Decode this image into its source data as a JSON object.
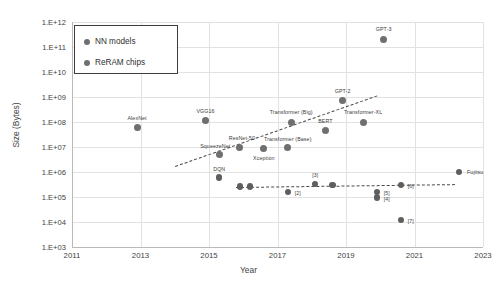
{
  "chart_data": {
    "type": "scatter",
    "title": "",
    "xlabel": "Year",
    "ylabel": "Size (Bytes)",
    "xlim": [
      2011,
      2023
    ],
    "ylim": [
      1000,
      1000000000000
    ],
    "yscale": "log",
    "grid": true,
    "legend_position": "top-left",
    "xticks": [
      "2011",
      "2013",
      "2015",
      "2017",
      "2019",
      "2021",
      "2023"
    ],
    "yticks": [
      "1.E+12",
      "1.E+11",
      "1.E+10",
      "1.E+09",
      "1.E+08",
      "1.E+07",
      "1.E+06",
      "1.E+05",
      "1.E+04",
      "1.E+03"
    ],
    "legend": [
      {
        "name": "NN models",
        "color": "#6f6f6f"
      },
      {
        "name": "ReRAM chips",
        "color": "#5e5e5e"
      }
    ],
    "series": [
      {
        "name": "NN models",
        "color": "#6f6f6f",
        "points": [
          {
            "label": "AlexNet",
            "x": 2012.9,
            "y": 60000000.0,
            "lx": 0,
            "ly": -10
          },
          {
            "label": "VGG16",
            "x": 2014.9,
            "y": 110000000.0,
            "lx": 0,
            "ly": -10
          },
          {
            "label": "SqueezeNet",
            "x": 2015.3,
            "y": 5000000.0,
            "lx": -4,
            "ly": -9
          },
          {
            "label": "ResNet-50",
            "x": 2015.9,
            "y": 10000000.0,
            "lx": 2,
            "ly": -9
          },
          {
            "label": "Xception",
            "x": 2016.6,
            "y": 9000000.0,
            "lx": 0,
            "ly": 10
          },
          {
            "label": "Transformer (Base)",
            "x": 2017.3,
            "y": 9500000.0,
            "lx": 0,
            "ly": -9
          },
          {
            "label": "Transformer (Big)",
            "x": 2017.4,
            "y": 100000000.0,
            "lx": 0,
            "ly": -10
          },
          {
            "label": "BERT",
            "x": 2018.4,
            "y": 45000000.0,
            "lx": 0,
            "ly": -10
          },
          {
            "label": "GPT-2",
            "x": 2018.9,
            "y": 700000000.0,
            "lx": 0,
            "ly": -10
          },
          {
            "label": "Transformer-XL",
            "x": 2019.5,
            "y": 100000000.0,
            "lx": 0,
            "ly": -10
          },
          {
            "label": "GPT-3",
            "x": 2020.1,
            "y": 200000000000.0,
            "lx": 0,
            "ly": -10
          }
        ],
        "trend": {
          "x1": 2014.0,
          "y1": 1800000.0,
          "x2": 2019.9,
          "y2": 1200000000.0
        }
      },
      {
        "name": "ReRAM chips",
        "color": "#5e5e5e",
        "points": [
          {
            "label": "DQN",
            "x": 2015.3,
            "y": 600000.0,
            "lx": 0,
            "ly": -9
          },
          {
            "label": "",
            "x": 2015.9,
            "y": 260000.0,
            "lx": 0,
            "ly": 0
          },
          {
            "label": "",
            "x": 2016.2,
            "y": 260000.0,
            "lx": 0,
            "ly": 0
          },
          {
            "label": "[2]",
            "x": 2017.3,
            "y": 160000.0,
            "lx": 7,
            "ly": 1
          },
          {
            "label": "[3]",
            "x": 2018.1,
            "y": 340000.0,
            "lx": 0,
            "ly": -9
          },
          {
            "label": "",
            "x": 2018.6,
            "y": 300000.0,
            "lx": 0,
            "ly": 0
          },
          {
            "label": "[5]",
            "x": 2019.9,
            "y": 160000.0,
            "lx": 7,
            "ly": 1
          },
          {
            "label": "[4]",
            "x": 2019.9,
            "y": 95000.0,
            "lx": 7,
            "ly": 1
          },
          {
            "label": "[6]",
            "x": 2020.6,
            "y": 300000.0,
            "lx": 7,
            "ly": 1
          },
          {
            "label": "[7]",
            "x": 2020.6,
            "y": 12000.0,
            "lx": 7,
            "ly": 1
          },
          {
            "label": "Fujitsu",
            "x": 2022.3,
            "y": 1000000.0,
            "lx": 8,
            "ly": 0
          }
        ],
        "trend": {
          "x1": 2015.8,
          "y1": 260000.0,
          "x2": 2022.2,
          "y2": 340000.0
        }
      }
    ]
  }
}
